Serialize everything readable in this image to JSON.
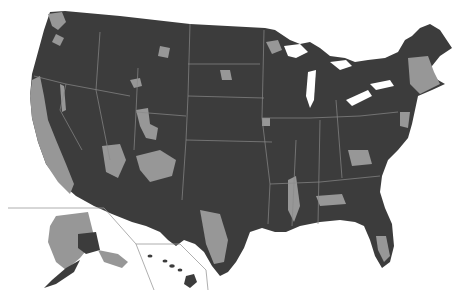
{
  "map": {
    "type": "choropleth",
    "region": "United States counties",
    "legend": null,
    "colors": {
      "category_dark": "#3c3c3c",
      "category_light": "#979797",
      "state_borders": "#8a8a8a",
      "background": "#ffffff",
      "inset_lines": "#9a9a9a"
    },
    "insets": [
      "Alaska",
      "Hawaii"
    ],
    "light_regions": [
      "California coast and Central Valley",
      "Nevada / Utah / Arizona / New Mexico patches",
      "Colorado Front Range",
      "Southern Texas",
      "Mississippi Delta",
      "Central Alabama/Georgia belt",
      "Southern Florida",
      "Northeastern Minnesota",
      "New England / New York corridor",
      "Western Washington",
      "Most of Alaska"
    ]
  }
}
